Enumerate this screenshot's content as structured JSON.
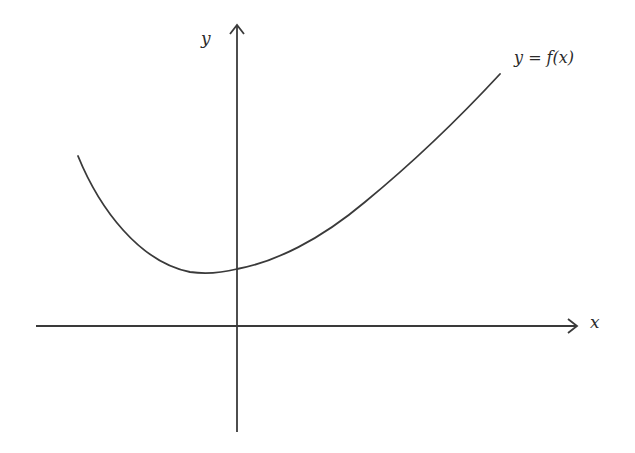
{
  "diagram": {
    "type": "function-graph",
    "axes": {
      "x_label": "x",
      "y_label": "y"
    },
    "curve_label": "y = f(x)",
    "colors": {
      "stroke": "#3a3a3a",
      "background": "#ffffff"
    },
    "curve_description": "Decreasing from upper left to a minimum left of the y-axis (above the x-axis), crossing the y-axis at a positive value, then increasing steadily to the upper right"
  }
}
